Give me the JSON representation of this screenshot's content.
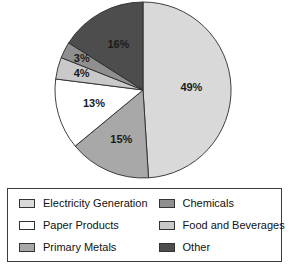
{
  "chart_data": {
    "type": "pie",
    "title": "",
    "subtitle": "",
    "xlabel": "",
    "ylabel": "",
    "legend_position": "bottom",
    "grid": false,
    "start_angle_deg": 0,
    "direction": "clockwise",
    "categories": [
      "Electricity Generation",
      "Primary Metals",
      "Paper Products",
      "Food and Beverages",
      "Chemicals",
      "Other"
    ],
    "values": [
      49,
      15,
      13,
      4,
      3,
      16
    ],
    "labels": [
      "49%",
      "15%",
      "13%",
      "4%",
      "3%",
      "16%"
    ],
    "colors": [
      "#d9d9d9",
      "#a8a8a8",
      "#ffffff",
      "#c9c9c9",
      "#8f8f8f",
      "#4d4d4d"
    ],
    "slices": [
      {
        "name": "Electricity Generation",
        "value": 49,
        "label": "49%",
        "color": "#d9d9d9"
      },
      {
        "name": "Primary Metals",
        "value": 15,
        "label": "15%",
        "color": "#a8a8a8"
      },
      {
        "name": "Paper Products",
        "value": 13,
        "label": "13%",
        "color": "#ffffff"
      },
      {
        "name": "Food and Beverages",
        "value": 4,
        "label": "4%",
        "color": "#c9c9c9"
      },
      {
        "name": "Chemicals",
        "value": 3,
        "label": "3%",
        "color": "#8f8f8f"
      },
      {
        "name": "Other",
        "value": 16,
        "label": "16%",
        "color": "#4d4d4d"
      }
    ]
  },
  "legend": {
    "items": [
      {
        "label": "Electricity Generation",
        "color": "#d9d9d9"
      },
      {
        "label": "Chemicals",
        "color": "#8f8f8f"
      },
      {
        "label": "Paper Products",
        "color": "#ffffff"
      },
      {
        "label": "Food and Beverages",
        "color": "#c9c9c9"
      },
      {
        "label": "Primary Metals",
        "color": "#a8a8a8"
      },
      {
        "label": "Other",
        "color": "#4d4d4d"
      }
    ]
  },
  "pie_geometry": {
    "cx": 143,
    "cy": 90,
    "r": 88
  }
}
